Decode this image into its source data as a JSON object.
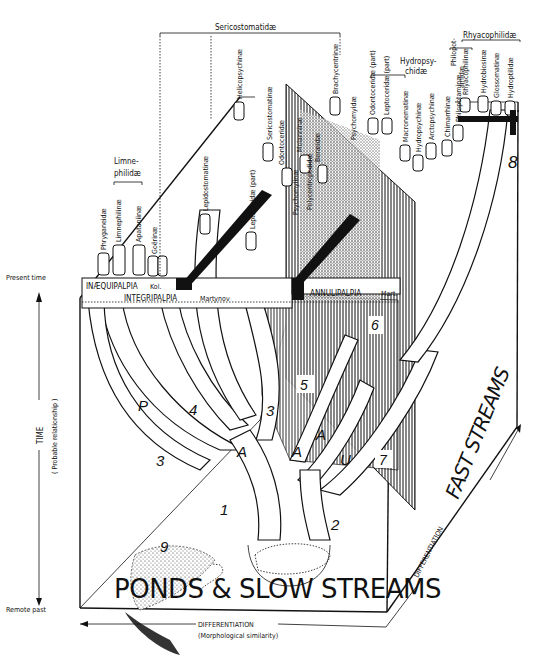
{
  "figure": {
    "type": "phylogenetic block diagram"
  },
  "axes": {
    "time_axis": {
      "label": "TIME",
      "sublabel": "( Probable relationship )",
      "top": "Present time",
      "bottom": "Remote past"
    },
    "differentiation_bottom": {
      "label": "DIFFERENTIATION",
      "sublabel": "(Morphological similarity)"
    },
    "differentiation_right": {
      "label": "DIFFERENTIATION"
    }
  },
  "habitats": {
    "slow": "PONDS & SLOW STREAMS",
    "fast": "FAST STREAMS"
  },
  "suborders": {
    "inaequipalpia": "INÆQUIPALPIA",
    "inaequipalpia_author": "Kol.",
    "integripalpia": "INTEGRIPALPIA",
    "integripalpia_author": "Martynov",
    "annulipalpia": "ANNULIPALPIA",
    "annulipalpia_author": "Mart."
  },
  "group_labels": {
    "sericostomatidae": "Sericostomatidæ",
    "limnephilidae_1": "Limne-",
    "limnephilidae_2": "philidæ",
    "hydropsychidae_1": "Hydropsy-",
    "hydropsychidae_2": "chidæ",
    "philopotamidae_1": "Philopot-",
    "philopotamidae_2": "amidæ",
    "rhyacophilidae": "Rhyacophilidæ"
  },
  "taxa": [
    {
      "name": "Phryganeidæ"
    },
    {
      "name": "Limnephilinæ"
    },
    {
      "name": "Apataniinæ"
    },
    {
      "name": "Goërinæ"
    },
    {
      "name": "Lepidostomatinæ"
    },
    {
      "name": "Helicopsychinæ"
    },
    {
      "name": "Leptoceridæ (part)"
    },
    {
      "name": "Sericostomatinæ"
    },
    {
      "name": "Odontoceridæ"
    },
    {
      "name": "Molanninæ"
    },
    {
      "name": "Beræidæ"
    },
    {
      "name": "Brachycentrinæ"
    },
    {
      "name": "Psychomyidæ"
    },
    {
      "name": "Psychomyiinæ"
    },
    {
      "name": "Polycentropodidæ"
    },
    {
      "name": "Odontoceridæ (part)"
    },
    {
      "name": "Leptoceridæ (part)"
    },
    {
      "name": "Macronematinæ"
    },
    {
      "name": "Hydropsychinæ"
    },
    {
      "name": "Arctopsychinæ"
    },
    {
      "name": "Chimarrhinæ"
    },
    {
      "name": "Philopotaminæ"
    },
    {
      "name": "Rhyacophilinæ"
    },
    {
      "name": "Hydrobiosinæ"
    },
    {
      "name": "Glossomatinæ"
    },
    {
      "name": "Hydroptilidæ"
    }
  ],
  "branch_markers": {
    "p": "P",
    "n3a": "3",
    "n3b": "3",
    "n4": "4",
    "a1": "A",
    "a2": "A",
    "a3": "A",
    "u": "U",
    "n1": "1",
    "n2": "2",
    "n5": "5",
    "n6": "6",
    "n7": "7",
    "n8": "8",
    "n9": "9"
  }
}
